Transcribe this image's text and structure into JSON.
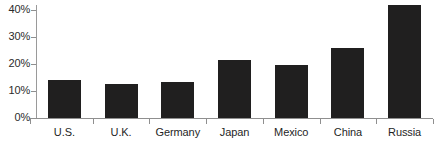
{
  "chart_data": {
    "type": "bar",
    "title": "",
    "subtitle": "",
    "xlabel": "",
    "ylabel": "",
    "categories": [
      "U.S.",
      "U.K.",
      "Germany",
      "Japan",
      "Mexico",
      "China",
      "Russia"
    ],
    "values": [
      14,
      12.5,
      13.5,
      21.5,
      19.5,
      26,
      42
    ],
    "value_format": "percent",
    "ylim": [
      0,
      45
    ],
    "ytick_values": [
      0,
      10,
      20,
      30,
      40
    ],
    "ytick_labels": [
      "0%",
      "10%",
      "20%",
      "30%",
      "40%"
    ],
    "grid": false,
    "legend": false,
    "legend_position": "none",
    "bar_color": "#201f1f",
    "axis_color": "#8f8f8f",
    "background_color": "#ffffff",
    "series": [
      {
        "name": "",
        "values": [
          14,
          12.5,
          13.5,
          21.5,
          19.5,
          26,
          42
        ]
      }
    ]
  }
}
